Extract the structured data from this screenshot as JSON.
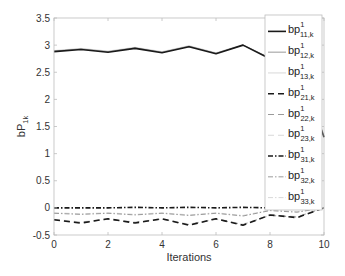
{
  "chart_data": {
    "type": "line",
    "title": "",
    "xlabel": "Iterations",
    "ylabel": "bP_{1k}",
    "ylabel_main": "bP",
    "ylabel_sub": "1k",
    "xlim": [
      0,
      10
    ],
    "ylim": [
      -0.5,
      3.5
    ],
    "xticks": [
      0,
      2,
      4,
      6,
      8,
      10
    ],
    "xtick_labels": [
      "0",
      "2",
      "4",
      "6",
      "8",
      "10"
    ],
    "yticks": [
      -0.5,
      0,
      0.5,
      1,
      1.5,
      2,
      2.5,
      3,
      3.5
    ],
    "ytick_labels": [
      "-0.5",
      "0",
      "0.5",
      "1",
      "1.5",
      "2",
      "2.5",
      "3",
      "3.5"
    ],
    "grid": false,
    "legend_position": "upper right",
    "x": [
      0,
      1,
      2,
      3,
      4,
      5,
      6,
      7,
      8,
      9,
      10
    ],
    "series": [
      {
        "name": "bp^1_{11,k}",
        "label_main": "bp",
        "label_sup": "1",
        "label_sub": "11,k",
        "color": "#1a1a1a",
        "width": 1.6,
        "dash": "",
        "values": [
          2.88,
          2.92,
          2.87,
          2.94,
          2.86,
          2.97,
          2.84,
          3.0,
          2.75,
          2.7,
          1.3
        ]
      },
      {
        "name": "bp^1_{12,k}",
        "label_main": "bp",
        "label_sup": "1",
        "label_sub": "12,k",
        "color": "#9a9a9a",
        "width": 1.0,
        "dash": "",
        "values": [
          2.89,
          2.93,
          2.88,
          2.95,
          2.87,
          2.98,
          2.85,
          3.0,
          2.76,
          2.71,
          1.32
        ]
      },
      {
        "name": "bp^1_{13,k}",
        "label_main": "bp",
        "label_sup": "1",
        "label_sub": "13,k",
        "color": "#d8d8d8",
        "width": 1.0,
        "dash": "",
        "values": [
          2.9,
          2.94,
          2.89,
          2.96,
          2.88,
          2.99,
          2.86,
          3.01,
          2.77,
          2.72,
          1.34
        ]
      },
      {
        "name": "bp^1_{21,k}",
        "label_main": "bp",
        "label_sup": "1",
        "label_sub": "21,k",
        "color": "#1a1a1a",
        "width": 1.6,
        "dash": "6,4",
        "values": [
          -0.22,
          -0.28,
          -0.2,
          -0.28,
          -0.2,
          -0.32,
          -0.2,
          -0.32,
          -0.13,
          -0.18,
          0.0
        ]
      },
      {
        "name": "bp^1_{22,k}",
        "label_main": "bp",
        "label_sup": "1",
        "label_sub": "22,k",
        "color": "#9a9a9a",
        "width": 1.0,
        "dash": "6,4",
        "values": [
          -0.22,
          -0.27,
          -0.21,
          -0.27,
          -0.21,
          -0.31,
          -0.21,
          -0.31,
          -0.14,
          -0.17,
          0.0
        ]
      },
      {
        "name": "bp^1_{23,k}",
        "label_main": "bp",
        "label_sup": "1",
        "label_sub": "23,k",
        "color": "#d8d8d8",
        "width": 1.0,
        "dash": "6,4",
        "values": [
          -0.21,
          -0.26,
          -0.2,
          -0.26,
          -0.2,
          -0.3,
          -0.2,
          -0.3,
          -0.13,
          -0.16,
          0.0
        ]
      },
      {
        "name": "bp^1_{31,k}",
        "label_main": "bp",
        "label_sup": "1",
        "label_sub": "31,k",
        "color": "#1a1a1a",
        "width": 1.6,
        "dash": "5,2,1.5,2",
        "values": [
          0.0,
          0.0,
          0.0,
          0.01,
          0.0,
          0.01,
          0.0,
          0.01,
          0.0,
          -0.01,
          0.0
        ]
      },
      {
        "name": "bp^1_{32,k}",
        "label_main": "bp",
        "label_sup": "1",
        "label_sub": "32,k",
        "color": "#9a9a9a",
        "width": 1.0,
        "dash": "5,2,1.5,2",
        "values": [
          -0.1,
          -0.12,
          -0.1,
          -0.13,
          -0.1,
          -0.14,
          -0.1,
          -0.15,
          -0.05,
          -0.08,
          0.0
        ]
      },
      {
        "name": "bp^1_{33,k}",
        "label_main": "bp",
        "label_sup": "1",
        "label_sub": "33,k",
        "color": "#d8d8d8",
        "width": 1.0,
        "dash": "5,2,1.5,2",
        "values": [
          -0.09,
          -0.11,
          -0.09,
          -0.12,
          -0.09,
          -0.13,
          -0.09,
          -0.14,
          -0.04,
          -0.07,
          0.0
        ]
      }
    ]
  },
  "layout": {
    "plot": {
      "left": 54,
      "top": 18,
      "right": 324,
      "bottom": 235
    },
    "legend": {
      "left": 265,
      "top": 15,
      "width": 57,
      "height": 195
    }
  }
}
